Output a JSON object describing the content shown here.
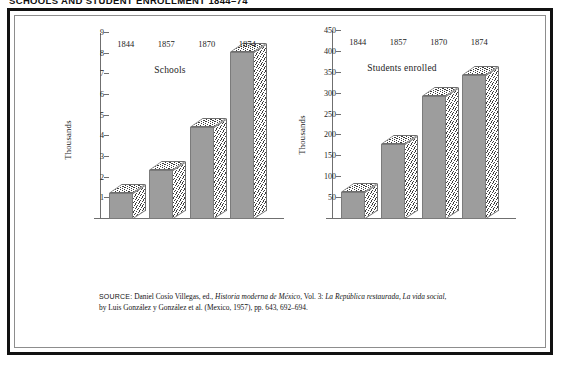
{
  "page_heading": "SCHOOLS AND STUDENT ENROLLMENT 1844–74",
  "source": {
    "label": "SOURCE:",
    "line1_a": " Daniel Cosío Villegas, ed., ",
    "line1_italic1": "Historia moderna de México",
    "line1_b": ", Vol. 3: ",
    "line1_italic2": "La República restaurada, La vida social",
    "line1_c": ",",
    "line2": "by Luis González y González et al. (Mexico, 1957), pp. 643, 692–694."
  },
  "chart_data": [
    {
      "id": "schools",
      "type": "bar",
      "title": "Schools",
      "xlabel": "",
      "ylabel": "Thousands",
      "categories": [
        "1844",
        "1857",
        "1870",
        "1874"
      ],
      "values": [
        1.25,
        2.35,
        4.45,
        8.1
      ],
      "yticks": [
        1,
        2,
        3,
        4,
        5,
        6,
        7,
        8,
        9
      ],
      "ylim": [
        0,
        9
      ],
      "grid": false,
      "legend": "none",
      "style": "3d-hatched-bars"
    },
    {
      "id": "students",
      "type": "bar",
      "title": "Students enrolled",
      "xlabel": "",
      "ylabel": "Thousands",
      "categories": [
        "1844",
        "1857",
        "1870",
        "1874"
      ],
      "values": [
        65,
        180,
        295,
        345
      ],
      "yticks": [
        50,
        100,
        150,
        200,
        250,
        300,
        350,
        400,
        450
      ],
      "ylim": [
        0,
        450
      ],
      "grid": false,
      "legend": "none",
      "style": "3d-hatched-bars"
    }
  ],
  "colors": {
    "bar_face": "#9d9d9d",
    "bar_outline": "#7b7b7b",
    "hatch": "#3d3d3d",
    "frame_outer": "#111111",
    "frame_inner": "#8d8d8d",
    "axis": "#6f6f6f",
    "text": "#1a1a1a"
  }
}
